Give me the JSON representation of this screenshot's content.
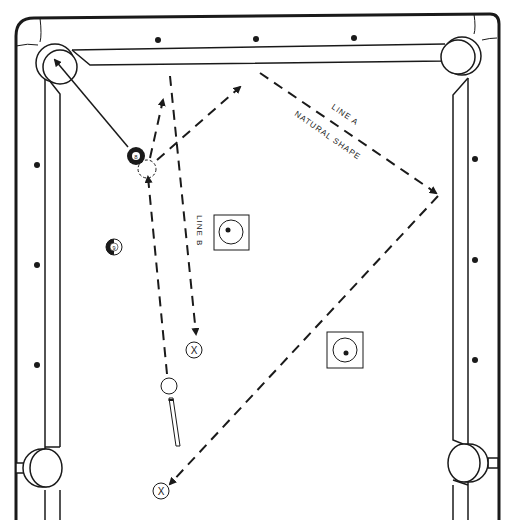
{
  "diagram": {
    "type": "pool-table-shot-diagram",
    "colors": {
      "ink": "#1a1a1a",
      "paper": "#ffffff"
    },
    "labels": {
      "line_a": "LINE A",
      "line_a_sub": "NATURAL SHAPE",
      "line_b": "LINE B",
      "eight_ball": "8",
      "nine_ball": "9",
      "target_x": "X"
    },
    "balls": [
      {
        "id": "eight-ball",
        "number": "8",
        "style": "solid-black"
      },
      {
        "id": "nine-ball",
        "number": "9",
        "style": "striped"
      },
      {
        "id": "cue-ball",
        "number": "",
        "style": "white"
      },
      {
        "id": "ghost-ball",
        "number": "",
        "style": "dashed-outline"
      }
    ],
    "targets": [
      {
        "id": "target-x-upper",
        "symbol": "X"
      },
      {
        "id": "target-x-lower",
        "symbol": "X"
      }
    ],
    "position_markers": [
      {
        "id": "position-zone-upper"
      },
      {
        "id": "position-zone-lower"
      }
    ],
    "diamonds": {
      "top": 3,
      "left": 3,
      "right": 3
    }
  }
}
